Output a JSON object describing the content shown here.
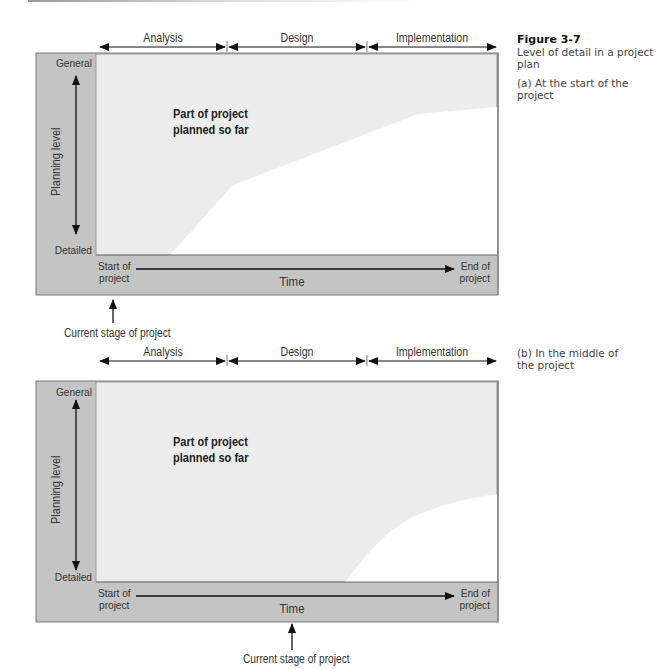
{
  "figure": {
    "number": "Figure 3-7",
    "title": "Level of detail in a project plan"
  },
  "diagrams": [
    {
      "id": "a",
      "caption": "(a) At the start of the project",
      "phases": [
        "Analysis",
        "Design",
        "Implementation"
      ],
      "y_axis": {
        "label": "Planning level",
        "top": "General",
        "bottom": "Detailed"
      },
      "x_axis": {
        "label": "Time",
        "start": "Start of project",
        "start_line1": "Start of",
        "start_line2": "project",
        "end_line1": "End of",
        "end_line2": "project"
      },
      "region_label_line1": "Part of project",
      "region_label_line2": "planned so far",
      "marker_label": "Current stage of project",
      "marker_position": "start"
    },
    {
      "id": "b",
      "caption": "(b) In the middle of the project",
      "phases": [
        "Analysis",
        "Design",
        "Implementation"
      ],
      "y_axis": {
        "label": "Planning level",
        "top": "General",
        "bottom": "Detailed"
      },
      "x_axis": {
        "label": "Time",
        "start_line1": "Start of",
        "start_line2": "project",
        "end_line1": "End of",
        "end_line2": "project"
      },
      "region_label_line1": "Part of project",
      "region_label_line2": "planned so far",
      "marker_label": "Current stage of project",
      "marker_position": "middle"
    }
  ],
  "colors": {
    "frame_gray": "#c4c4c4",
    "planned_region": "#ececec",
    "unplanned_region": "#ffffff",
    "border": "#7a7a7a",
    "arrow": "#111111"
  }
}
